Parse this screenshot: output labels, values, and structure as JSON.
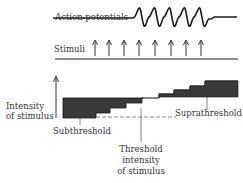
{
  "diagram": {
    "action_potentials_label": "Action potentials",
    "stimuli_label": "Stimuli",
    "y_axis_label_line1": "Intensity",
    "y_axis_label_line2": "of stimulus",
    "subthreshold_label": "Subthreshold",
    "suprathreshold_label": "Suprathreshold",
    "threshold_label_line1": "Threshold",
    "threshold_label_line2": "intensity",
    "threshold_label_line3": "of stimulus",
    "stimulus_arrow_count": 8,
    "action_potential_count": 5,
    "colors": {
      "ink": "#1a1a1a",
      "fill": "#3a3a3a",
      "background": "#ffffff"
    }
  }
}
